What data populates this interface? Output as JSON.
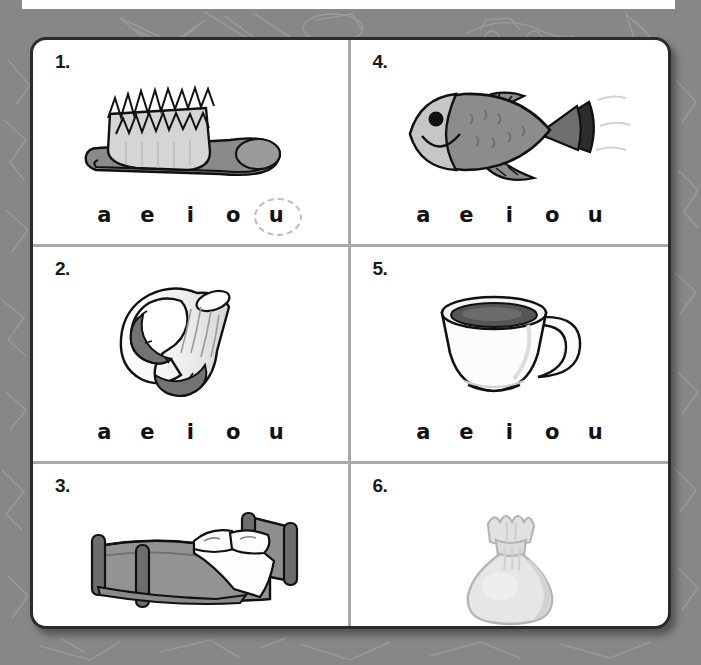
{
  "page": {
    "background_color": "#878787",
    "card_color": "#ffffff",
    "card_border_color": "#2b2b2b",
    "divider_color": "#a9a9a9",
    "selection_circle_color": "#bdbdbd"
  },
  "vowels": [
    "a",
    "e",
    "i",
    "o",
    "u"
  ],
  "items": [
    {
      "number": "1.",
      "picture": "hairbrush-illustration",
      "vowels": [
        "a",
        "e",
        "i",
        "o",
        "u"
      ],
      "selected_vowel": "u"
    },
    {
      "number": "2.",
      "picture": "sock-illustration",
      "vowels": [
        "a",
        "e",
        "i",
        "o",
        "u"
      ],
      "selected_vowel": null
    },
    {
      "number": "3.",
      "picture": "bed-illustration",
      "vowels": [
        "a",
        "e",
        "i",
        "o",
        "u"
      ],
      "selected_vowel": null
    },
    {
      "number": "4.",
      "picture": "fish-illustration",
      "vowels": [
        "a",
        "e",
        "i",
        "o",
        "u"
      ],
      "selected_vowel": null
    },
    {
      "number": "5.",
      "picture": "cup-illustration",
      "vowels": [
        "a",
        "e",
        "i",
        "o",
        "u"
      ],
      "selected_vowel": null
    },
    {
      "number": "6.",
      "picture": "bag-illustration",
      "vowels": [
        "a",
        "e",
        "i",
        "o",
        "u"
      ],
      "selected_vowel": null
    }
  ]
}
